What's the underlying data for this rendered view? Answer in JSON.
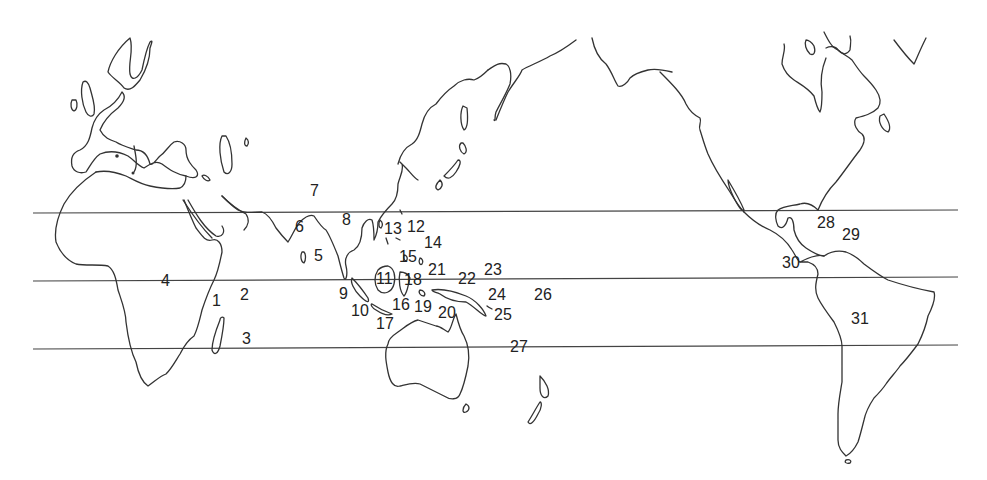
{
  "map": {
    "type": "world-outline-map",
    "projection_center": "Pacific",
    "colors": {
      "background": "#ffffff",
      "coastline": "#333333",
      "latitude_lines": "#444444",
      "labels": "#222222"
    },
    "latitude_lines": [
      {
        "name": "tropic-of-cancer",
        "y": 212
      },
      {
        "name": "equator",
        "y": 279
      },
      {
        "name": "tropic-of-capricorn",
        "y": 348
      }
    ],
    "labels": [
      {
        "id": "1",
        "text": "1",
        "x": 212,
        "y": 306
      },
      {
        "id": "2",
        "text": "2",
        "x": 240,
        "y": 300
      },
      {
        "id": "3",
        "text": "3",
        "x": 242,
        "y": 344
      },
      {
        "id": "4",
        "text": "4",
        "x": 161,
        "y": 286
      },
      {
        "id": "5",
        "text": "5",
        "x": 314,
        "y": 261
      },
      {
        "id": "6",
        "text": "6",
        "x": 295,
        "y": 232
      },
      {
        "id": "7",
        "text": "7",
        "x": 310,
        "y": 196
      },
      {
        "id": "8",
        "text": "8",
        "x": 342,
        "y": 225
      },
      {
        "id": "9",
        "text": "9",
        "x": 339,
        "y": 299
      },
      {
        "id": "10",
        "text": "10",
        "x": 351,
        "y": 316
      },
      {
        "id": "11",
        "text": "11",
        "x": 376,
        "y": 284
      },
      {
        "id": "12",
        "text": "12",
        "x": 407,
        "y": 232
      },
      {
        "id": "13",
        "text": "13",
        "x": 384,
        "y": 234
      },
      {
        "id": "14",
        "text": "14",
        "x": 424,
        "y": 248
      },
      {
        "id": "15",
        "text": "15",
        "x": 399,
        "y": 262
      },
      {
        "id": "16",
        "text": "16",
        "x": 392,
        "y": 310
      },
      {
        "id": "17",
        "text": "17",
        "x": 376,
        "y": 329
      },
      {
        "id": "18",
        "text": "18",
        "x": 404,
        "y": 285
      },
      {
        "id": "19",
        "text": "19",
        "x": 414,
        "y": 312
      },
      {
        "id": "20",
        "text": "20",
        "x": 438,
        "y": 318
      },
      {
        "id": "21",
        "text": "21",
        "x": 428,
        "y": 275
      },
      {
        "id": "22",
        "text": "22",
        "x": 458,
        "y": 284
      },
      {
        "id": "23",
        "text": "23",
        "x": 484,
        "y": 275
      },
      {
        "id": "24",
        "text": "24",
        "x": 488,
        "y": 300
      },
      {
        "id": "25",
        "text": "25",
        "x": 494,
        "y": 320
      },
      {
        "id": "26",
        "text": "26",
        "x": 534,
        "y": 300
      },
      {
        "id": "27",
        "text": "27",
        "x": 510,
        "y": 352
      },
      {
        "id": "28",
        "text": "28",
        "x": 817,
        "y": 228
      },
      {
        "id": "29",
        "text": "29",
        "x": 842,
        "y": 240
      },
      {
        "id": "30",
        "text": "30",
        "x": 782,
        "y": 268
      },
      {
        "id": "31",
        "text": "31",
        "x": 851,
        "y": 324
      }
    ]
  }
}
